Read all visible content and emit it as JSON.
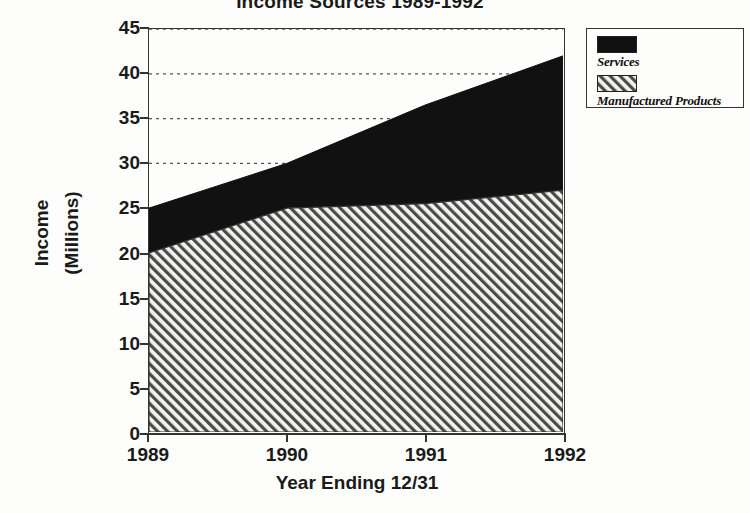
{
  "chart_data": {
    "type": "area",
    "stacked": true,
    "title": "Income Sources 1989-1992",
    "xlabel": "Year Ending 12/31",
    "ylabel_line1": "Income",
    "ylabel_line2": "(Millions)",
    "categories": [
      "1989",
      "1990",
      "1991",
      "1992"
    ],
    "x": [
      1989,
      1990,
      1991,
      1992
    ],
    "ylim": [
      0,
      45
    ],
    "yticks": [
      0,
      5,
      10,
      15,
      20,
      25,
      30,
      35,
      40,
      45
    ],
    "ytick_labels": [
      "0",
      "5",
      "10",
      "15",
      "20",
      "25",
      "30",
      "35",
      "40",
      "45"
    ],
    "grid": "horizontal-dotted",
    "legend_position": "outside-top-right",
    "series": [
      {
        "name": "Manufactured Products",
        "fill": "diagonal-hatch",
        "color": "#bdbdbd",
        "values": [
          20,
          25,
          25.5,
          27
        ]
      },
      {
        "name": "Services",
        "fill": "solid",
        "color": "#111111",
        "values": [
          5,
          5,
          11,
          15
        ]
      }
    ],
    "stack_totals": [
      25,
      30,
      36.5,
      42
    ]
  },
  "legend": {
    "items": [
      {
        "label": "Services",
        "swatch": "solid-black-swatch"
      },
      {
        "label": "Manufactured Products",
        "swatch": "hatched-swatch"
      }
    ]
  },
  "axes": {
    "y_title_line1": "Income",
    "y_title_line2": "(Millions)",
    "x_title": "Year Ending 12/31"
  }
}
